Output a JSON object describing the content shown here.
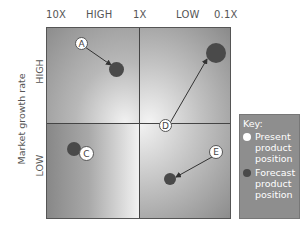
{
  "x_axis": {
    "ticks": [
      "10X",
      "HIGH",
      "1X",
      "LOW",
      "0.1X"
    ]
  },
  "y_axis": {
    "title": "Market growth rate",
    "high_label": "HIGH",
    "low_label": "LOW"
  },
  "products": [
    {
      "id": "A",
      "quadrant": "top-left",
      "present": "A",
      "forecast": "dark circle (moves right/down)"
    },
    {
      "id": "B",
      "note": "not shown"
    },
    {
      "id": "C",
      "quadrant": "bottom-left",
      "present": "C",
      "forecast": "dark circle (overlapping, left)"
    },
    {
      "id": "D",
      "quadrant": "top-right",
      "present": "D",
      "forecast": "large dark circle (upper right)"
    },
    {
      "id": "E",
      "quadrant": "bottom-right",
      "present": "E",
      "forecast": "dark circle (lower left)"
    }
  ],
  "markers": {
    "A": "A",
    "C": "C",
    "D": "D",
    "E": "E"
  },
  "key": {
    "title": "Key:",
    "present_label": "Present product position",
    "forecast_label": "Forecast product position",
    "present_color": "#ffffff",
    "forecast_color": "#4a4a4a"
  },
  "colors": {
    "frame": "#555555",
    "key_bg": "#8e8e8e"
  }
}
